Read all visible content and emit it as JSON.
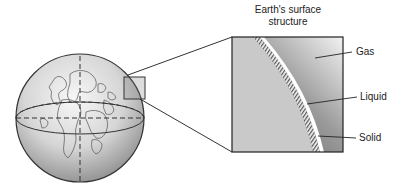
{
  "diagram": {
    "title_line1": "Earth's surface",
    "title_line2": "structure",
    "labels": {
      "gas": "Gas",
      "liquid": "Liquid",
      "solid": "Solid"
    },
    "colors": {
      "globe_light": "#f4f4f4",
      "globe_dark": "#8a8a8a",
      "inset_surface": "#c8c8c8",
      "gas_dark": "#666666",
      "gas_light": "#eeeeee",
      "outline": "#222222"
    }
  }
}
